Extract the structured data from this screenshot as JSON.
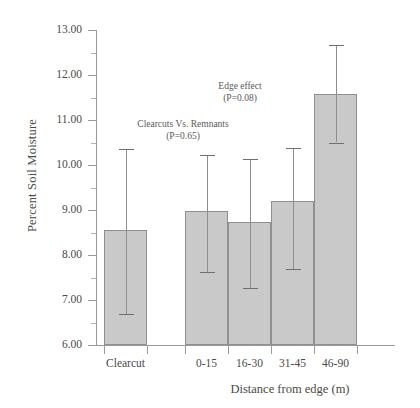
{
  "chart_data": {
    "type": "bar",
    "title": "",
    "xlabel": "Distance from edge (m)",
    "ylabel": "Percent Soil Moisture",
    "categories": [
      "Clearcut",
      "0-15",
      "16-30",
      "31-45",
      "46-90"
    ],
    "values": [
      8.55,
      8.98,
      8.73,
      9.2,
      11.57
    ],
    "error_low": [
      6.7,
      7.62,
      7.27,
      7.68,
      10.5
    ],
    "error_high": [
      10.35,
      10.22,
      10.13,
      10.38,
      12.67
    ],
    "ylim": [
      6.0,
      13.0
    ],
    "ytick_labels": [
      "6.00",
      "7.00",
      "8.00",
      "9.00",
      "10.00",
      "11.00",
      "12.00",
      "13.00"
    ],
    "ytick_values": [
      6.0,
      7.0,
      8.0,
      9.0,
      10.0,
      11.0,
      12.0,
      13.0
    ],
    "yminor_values": [
      6.5,
      7.5,
      8.5,
      9.5,
      10.5,
      11.5,
      12.5
    ],
    "grid": false,
    "legend": null,
    "bar_color": "#c9c9c9",
    "bar_edge_color": "#8f8f8f",
    "annotations": [
      {
        "line1": "Clearcuts Vs. Remnants",
        "line2": "(P=0.65)",
        "x": 183,
        "y": 118
      },
      {
        "line1": "Edge effect",
        "line2": "(P=0.08)",
        "x": 240,
        "y": 80
      }
    ]
  }
}
